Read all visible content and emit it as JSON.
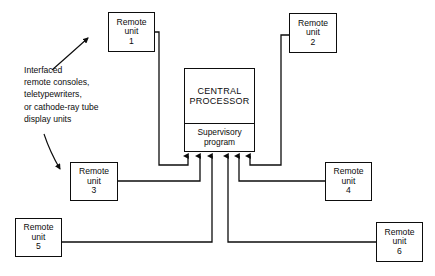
{
  "diagram": {
    "caption": {
      "lines": [
        "Interfaced",
        "remote consoles,",
        "teletypewriters,",
        "or cathode-ray tube",
        "display units"
      ]
    },
    "central_processor": {
      "title_line1": "CENTRAL",
      "title_line2": "PROCESSOR",
      "sub_line1": "Supervisory",
      "sub_line2": "program"
    },
    "remote_units": [
      {
        "line1": "Remote",
        "line2": "unit",
        "number": "1"
      },
      {
        "line1": "Remote",
        "line2": "unit",
        "number": "2"
      },
      {
        "line1": "Remote",
        "line2": "unit",
        "number": "3"
      },
      {
        "line1": "Remote",
        "line2": "unit",
        "number": "4"
      },
      {
        "line1": "Remote",
        "line2": "unit",
        "number": "5"
      },
      {
        "line1": "Remote",
        "line2": "unit",
        "number": "6"
      }
    ],
    "colors": {
      "stroke": "#0d0d0d",
      "background": "#ffffff"
    }
  }
}
